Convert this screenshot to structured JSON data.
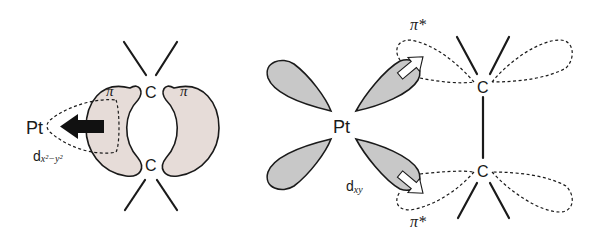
{
  "diagram": {
    "colors": {
      "pi_lobe_fill": "#e6dcd8",
      "d_lobe_fill": "#c8c8c8",
      "stroke": "#1a1a1a",
      "background": "#ffffff"
    },
    "left_panel": {
      "metal_label": "Pt",
      "orbital_label": "d",
      "orbital_subscript": "x²−y²",
      "pi_label_left": "π",
      "pi_label_right": "π",
      "carbon_top": "C",
      "carbon_bottom": "C",
      "arrow_direction": "toward metal (sigma donation)"
    },
    "right_panel": {
      "metal_label": "Pt",
      "orbital_label": "d",
      "orbital_subscript": "xy",
      "pi_star_top": "π*",
      "pi_star_bottom": "π*",
      "carbon_top": "C",
      "carbon_bottom": "C",
      "arrow_direction": "toward alkene (pi back-donation)"
    }
  }
}
